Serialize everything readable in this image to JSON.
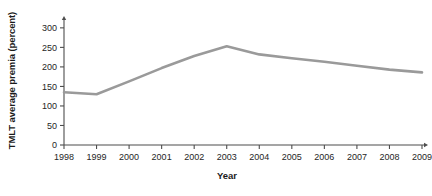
{
  "chart_data": {
    "type": "line",
    "title": "",
    "xlabel": "Year",
    "ylabel": "TMLT average premia (percent)",
    "categories": [
      "1998",
      "1999",
      "2000",
      "2001",
      "2002",
      "2003",
      "2004",
      "2005",
      "2006",
      "2007",
      "2008",
      "2009"
    ],
    "x": [
      1998,
      1999,
      2000,
      2001,
      2002,
      2003,
      2004,
      2005,
      2006,
      2007,
      2008,
      2009
    ],
    "values": [
      135,
      130,
      163,
      197,
      228,
      253,
      232,
      222,
      213,
      203,
      193,
      186
    ],
    "series": [
      {
        "name": "TMLT average premia",
        "values": [
          135,
          130,
          163,
          197,
          228,
          253,
          232,
          222,
          213,
          203,
          193,
          186
        ],
        "color": "#9a9a9a"
      }
    ],
    "ylim": [
      0,
      315
    ],
    "xlim": [
      1998,
      2009
    ],
    "yticks": [
      0,
      50,
      100,
      150,
      200,
      250,
      300
    ],
    "ytick_labels": [
      "0",
      "50",
      "100",
      "150",
      "200",
      "250",
      "300"
    ],
    "xticks": [
      1998,
      1999,
      2000,
      2001,
      2002,
      2003,
      2004,
      2005,
      2006,
      2007,
      2008,
      2009
    ],
    "xtick_labels": [
      "1998",
      "1999",
      "2000",
      "2001",
      "2002",
      "2003",
      "2004",
      "2005",
      "2006",
      "2007",
      "2008",
      "2009"
    ],
    "grid": false,
    "legend": false,
    "legend_position": "none",
    "axis_color": "#4d4d4d",
    "text_color": "#262626",
    "background_color": "#ffffff"
  }
}
